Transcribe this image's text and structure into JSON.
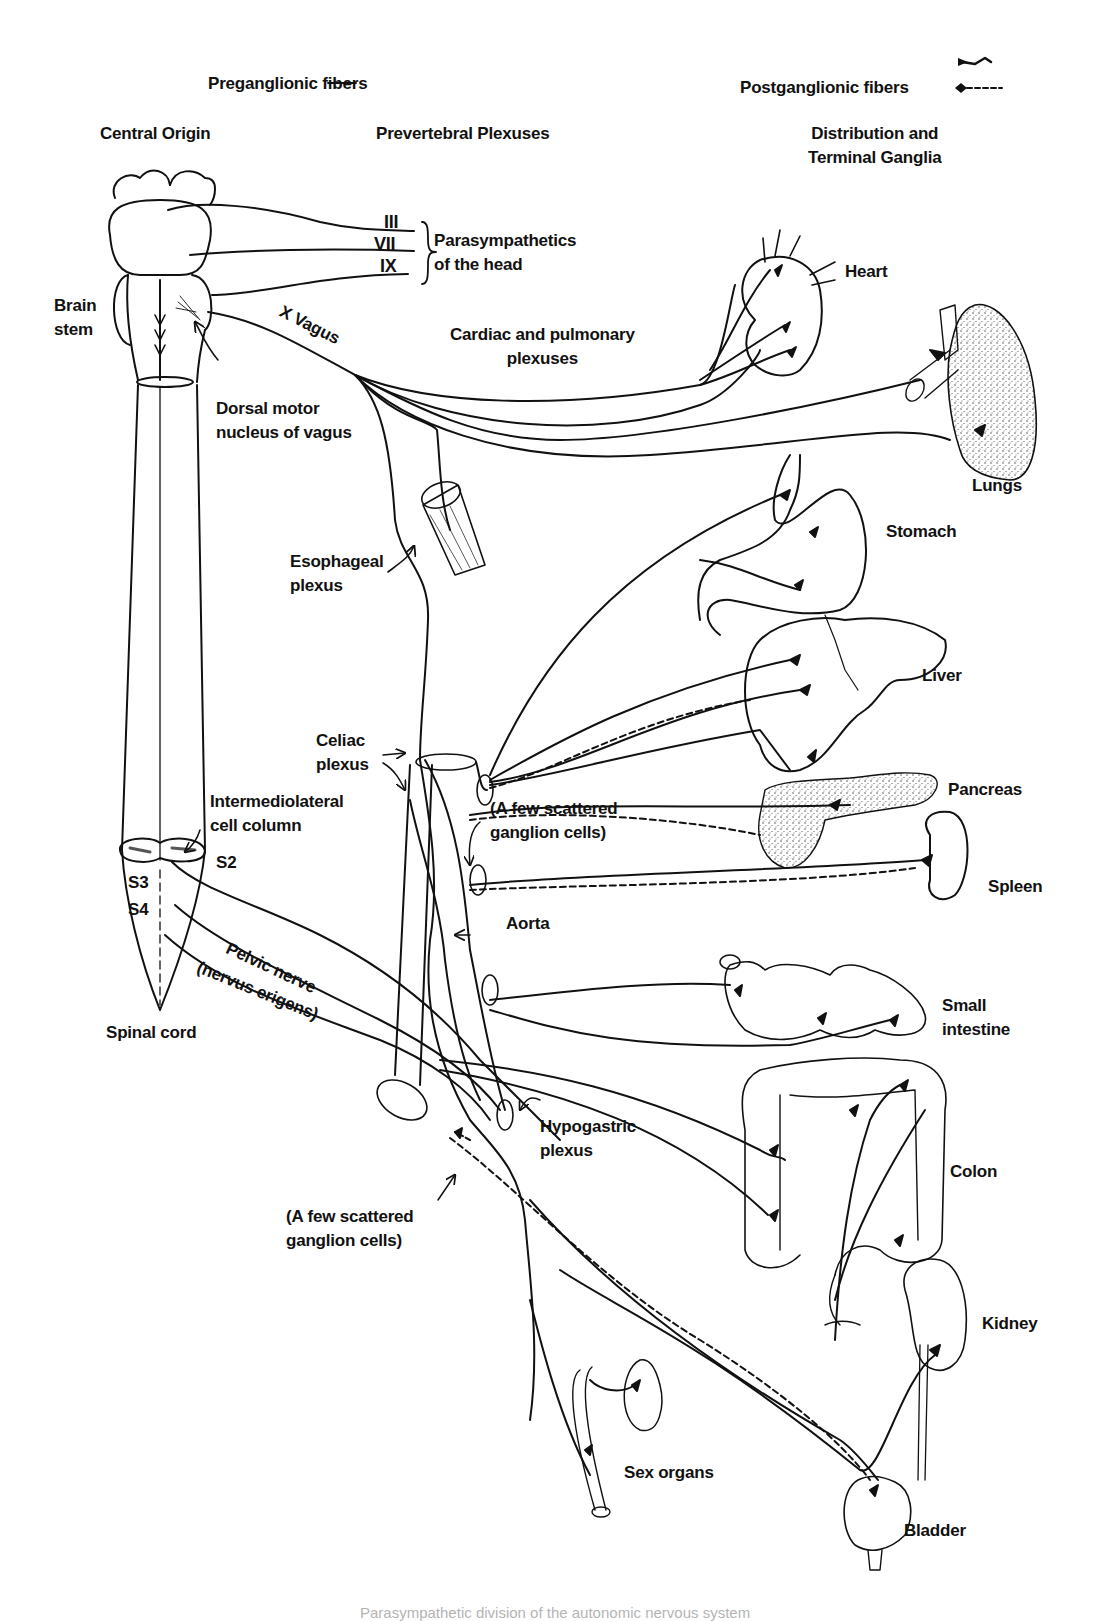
{
  "legend": {
    "preganglionic": "Preganglionic fibers",
    "postganglionic": "Postganglionic fibers",
    "preganglionic_style": "solid",
    "postganglionic_style": "dashed"
  },
  "columns": {
    "central_origin": "Central Origin",
    "prevertebral": "Prevertebral Plexuses",
    "distribution": "Distribution and\nTerminal Ganglia"
  },
  "cranial_nerves": [
    "III",
    "VII",
    "IX"
  ],
  "labels": {
    "head": "Parasympathetics\nof the head",
    "brain_stem": "Brain\nstem",
    "vagus": "X Vagus",
    "dorsal_motor": "Dorsal motor\nnucleus of vagus",
    "cardiac_pulmonary": "Cardiac and pulmonary\nplexuses",
    "esophageal": "Esophageal\nplexus",
    "celiac": "Celiac\nplexus",
    "intermediolateral": "Intermediolateral\ncell column",
    "scattered_1": "(A few scattered\nganglion cells)",
    "aorta": "Aorta",
    "pelvic_nerve": "Pelvic nerve",
    "nervus_erigens": "(nervus erigens)",
    "spinal_cord": "Spinal cord",
    "hypogastric": "Hypogastric\nplexus",
    "scattered_2": "(A few scattered\nganglion cells)",
    "s2": "S2",
    "s3": "S3",
    "s4": "S4"
  },
  "organs": {
    "heart": "Heart",
    "lungs": "Lungs",
    "stomach": "Stomach",
    "liver": "Liver",
    "pancreas": "Pancreas",
    "spleen": "Spleen",
    "small_intestine": "Small\nintestine",
    "colon": "Colon",
    "kidney": "Kidney",
    "sex_organs": "Sex organs",
    "bladder": "Bladder"
  },
  "caption": "Parasympathetic division of the autonomic nervous system",
  "colors": {
    "ink": "#111111",
    "paper": "#ffffff"
  }
}
